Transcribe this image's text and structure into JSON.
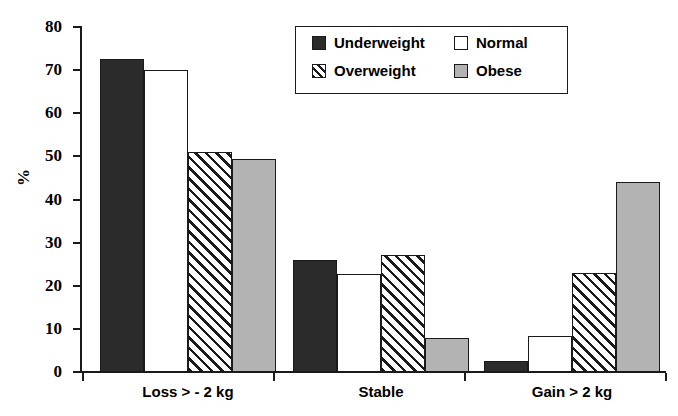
{
  "chart_data": {
    "type": "bar",
    "title": "",
    "xlabel": "",
    "ylabel": "%",
    "ylim": [
      0,
      80
    ],
    "yticks": [
      0,
      10,
      20,
      30,
      40,
      50,
      60,
      70,
      80
    ],
    "grid": false,
    "legend_position": "top-center",
    "categories": [
      "Loss > - 2 kg",
      "Stable",
      "Gain > 2 kg"
    ],
    "series": [
      {
        "name": "Underweight",
        "color": "#2b2b2b",
        "pattern": "solid-black",
        "values": [
          72.5,
          26,
          2.5
        ]
      },
      {
        "name": "Normal",
        "color": "#ffffff",
        "pattern": "solid-white",
        "values": [
          70,
          22.7,
          8.3
        ]
      },
      {
        "name": "Overweight",
        "color": "#ffffff",
        "pattern": "diagonal-hatch",
        "values": [
          51,
          27.2,
          23
        ]
      },
      {
        "name": "Obese",
        "color": "#b3b3b3",
        "pattern": "solid-gray",
        "values": [
          49.3,
          8,
          44
        ]
      }
    ]
  },
  "axes": {
    "y_label": "%",
    "y_tick_labels": [
      "80",
      "70",
      "60",
      "50",
      "40",
      "30",
      "20",
      "10",
      "0"
    ],
    "x_tick_labels": [
      "Loss > - 2 kg",
      "Stable",
      "Gain > 2 kg"
    ]
  },
  "legend": {
    "entries": [
      {
        "label": "Underweight",
        "swatch": "underweight"
      },
      {
        "label": "Normal",
        "swatch": "normal"
      },
      {
        "label": "Overweight",
        "swatch": "overweight"
      },
      {
        "label": "Obese",
        "swatch": "obese"
      }
    ]
  },
  "colors": {
    "axis": "#1a1a1a",
    "underweight": "#2b2b2b",
    "normal": "#ffffff",
    "overweight": "#ffffff",
    "obese": "#b3b3b3",
    "background": "#ffffff"
  }
}
